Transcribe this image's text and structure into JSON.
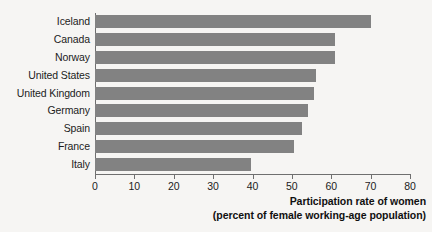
{
  "chart_data": {
    "type": "bar",
    "orientation": "horizontal",
    "title": "",
    "subtitle": "",
    "xlabel": "Participation rate of women",
    "xlabel_line2": "(percent of female working-age population)",
    "ylabel": "",
    "categories": [
      "Iceland",
      "Canada",
      "Norway",
      "United States",
      "United Kingdom",
      "Germany",
      "Spain",
      "France",
      "Italy"
    ],
    "values": [
      70,
      61,
      61,
      56,
      55.5,
      54,
      52.5,
      50.5,
      39.5
    ],
    "xticks": [
      0,
      10,
      20,
      30,
      40,
      50,
      60,
      70,
      80
    ],
    "xtick_labels": [
      "0",
      "10",
      "20",
      "30",
      "40",
      "50",
      "60",
      "70",
      "80"
    ],
    "xlim": [
      0,
      80
    ],
    "grid": false,
    "legend": null,
    "bar_color": "#828282",
    "axis_color": "#6f6f6f",
    "text_color": "#1c1c1c",
    "background_color": "#f6f5f3"
  }
}
